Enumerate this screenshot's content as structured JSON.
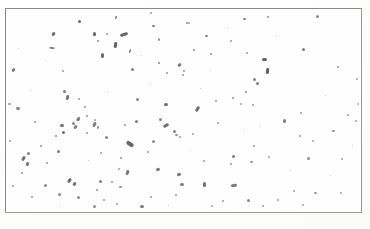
{
  "image": {
    "kind": "micrograph-field",
    "description": "Scanned light micrograph field showing scattered rod-shaped particles on a plain background within a thin rectangular border",
    "width": 370,
    "height": 229,
    "background_color": "#fdfdfc",
    "field_background_color": "#fefefe",
    "border_color": "#8d8d90",
    "particle_color": "#4a4a4e",
    "speck_color": "#b9b9bd"
  },
  "frame": {
    "x": 5,
    "y": 8,
    "width": 357,
    "height": 205
  },
  "particles": [
    {
      "x": 78,
      "y": 20,
      "w": 3,
      "h": 3,
      "r": 0,
      "o": 0.82
    },
    {
      "x": 115,
      "y": 16,
      "w": 2,
      "h": 3,
      "r": 20,
      "o": 0.7
    },
    {
      "x": 152,
      "y": 25,
      "w": 3,
      "h": 2,
      "r": 0,
      "o": 0.78
    },
    {
      "x": 186,
      "y": 22,
      "w": 2,
      "h": 2,
      "r": 0,
      "o": 0.62
    },
    {
      "x": 205,
      "y": 35,
      "w": 3,
      "h": 2,
      "r": 10,
      "o": 0.74
    },
    {
      "x": 243,
      "y": 18,
      "w": 3,
      "h": 2,
      "r": 0,
      "o": 0.72
    },
    {
      "x": 267,
      "y": 16,
      "w": 2,
      "h": 2,
      "r": 0,
      "o": 0.6
    },
    {
      "x": 316,
      "y": 15,
      "w": 3,
      "h": 3,
      "r": 0,
      "o": 0.66
    },
    {
      "x": 150,
      "y": 12,
      "w": 2,
      "h": 2,
      "r": 0,
      "o": 0.55
    },
    {
      "x": 52,
      "y": 32,
      "w": 3,
      "h": 4,
      "r": 35,
      "o": 0.8
    },
    {
      "x": 49,
      "y": 47,
      "w": 6,
      "h": 2,
      "r": 5,
      "o": 0.68
    },
    {
      "x": 93,
      "y": 32,
      "w": 3,
      "h": 4,
      "r": 0,
      "o": 0.85
    },
    {
      "x": 97,
      "y": 40,
      "w": 2,
      "h": 2,
      "r": 0,
      "o": 0.62
    },
    {
      "x": 106,
      "y": 33,
      "w": 2,
      "h": 2,
      "r": 0,
      "o": 0.55
    },
    {
      "x": 120,
      "y": 33,
      "w": 8,
      "h": 3,
      "r": -18,
      "o": 0.84
    },
    {
      "x": 114,
      "y": 42,
      "w": 3,
      "h": 6,
      "r": 8,
      "o": 0.86
    },
    {
      "x": 101,
      "y": 53,
      "w": 3,
      "h": 5,
      "r": 0,
      "o": 0.8
    },
    {
      "x": 129,
      "y": 49,
      "w": 2,
      "h": 4,
      "r": 20,
      "o": 0.66
    },
    {
      "x": 158,
      "y": 38,
      "w": 2,
      "h": 3,
      "r": 0,
      "o": 0.6
    },
    {
      "x": 158,
      "y": 62,
      "w": 2,
      "h": 2,
      "r": 0,
      "o": 0.66
    },
    {
      "x": 131,
      "y": 68,
      "w": 3,
      "h": 3,
      "r": 0,
      "o": 0.7
    },
    {
      "x": 166,
      "y": 72,
      "w": 2,
      "h": 2,
      "r": 0,
      "o": 0.58
    },
    {
      "x": 178,
      "y": 63,
      "w": 3,
      "h": 4,
      "r": 40,
      "o": 0.72
    },
    {
      "x": 182,
      "y": 74,
      "w": 2,
      "h": 2,
      "r": 0,
      "o": 0.55
    },
    {
      "x": 193,
      "y": 49,
      "w": 2,
      "h": 2,
      "r": 0,
      "o": 0.6
    },
    {
      "x": 210,
      "y": 53,
      "w": 2,
      "h": 2,
      "r": 0,
      "o": 0.62
    },
    {
      "x": 230,
      "y": 40,
      "w": 2,
      "h": 2,
      "r": 0,
      "o": 0.55
    },
    {
      "x": 246,
      "y": 52,
      "w": 2,
      "h": 2,
      "r": 0,
      "o": 0.58
    },
    {
      "x": 253,
      "y": 78,
      "w": 3,
      "h": 3,
      "r": 0,
      "o": 0.68
    },
    {
      "x": 262,
      "y": 58,
      "w": 5,
      "h": 3,
      "r": 0,
      "o": 0.86
    },
    {
      "x": 266,
      "y": 68,
      "w": 3,
      "h": 6,
      "r": 8,
      "o": 0.88
    },
    {
      "x": 256,
      "y": 82,
      "w": 3,
      "h": 3,
      "r": 0,
      "o": 0.7
    },
    {
      "x": 245,
      "y": 91,
      "w": 2,
      "h": 2,
      "r": 0,
      "o": 0.62
    },
    {
      "x": 232,
      "y": 97,
      "w": 2,
      "h": 2,
      "r": 0,
      "o": 0.58
    },
    {
      "x": 252,
      "y": 104,
      "w": 2,
      "h": 2,
      "r": 0,
      "o": 0.55
    },
    {
      "x": 302,
      "y": 48,
      "w": 3,
      "h": 3,
      "r": 0,
      "o": 0.7
    },
    {
      "x": 337,
      "y": 66,
      "w": 2,
      "h": 2,
      "r": 0,
      "o": 0.58
    },
    {
      "x": 356,
      "y": 78,
      "w": 2,
      "h": 2,
      "r": 0,
      "o": 0.52
    },
    {
      "x": 183,
      "y": 70,
      "w": 2,
      "h": 2,
      "r": 0,
      "o": 0.55
    },
    {
      "x": 188,
      "y": 22,
      "w": 2,
      "h": 2,
      "r": 0,
      "o": 0.52
    },
    {
      "x": 12,
      "y": 68,
      "w": 3,
      "h": 4,
      "r": 40,
      "o": 0.72
    },
    {
      "x": 16,
      "y": 107,
      "w": 4,
      "h": 3,
      "r": 25,
      "o": 0.66
    },
    {
      "x": 8,
      "y": 103,
      "w": 3,
      "h": 2,
      "r": 0,
      "o": 0.58
    },
    {
      "x": 63,
      "y": 90,
      "w": 3,
      "h": 3,
      "r": 0,
      "o": 0.74
    },
    {
      "x": 66,
      "y": 95,
      "w": 3,
      "h": 5,
      "r": 15,
      "o": 0.76
    },
    {
      "x": 78,
      "y": 98,
      "w": 2,
      "h": 2,
      "r": 0,
      "o": 0.58
    },
    {
      "x": 84,
      "y": 106,
      "w": 2,
      "h": 2,
      "r": 0,
      "o": 0.55
    },
    {
      "x": 62,
      "y": 70,
      "w": 2,
      "h": 2,
      "r": 0,
      "o": 0.55
    },
    {
      "x": 86,
      "y": 115,
      "w": 2,
      "h": 2,
      "r": 0,
      "o": 0.6
    },
    {
      "x": 60,
      "y": 124,
      "w": 4,
      "h": 3,
      "r": 0,
      "o": 0.78
    },
    {
      "x": 62,
      "y": 131,
      "w": 3,
      "h": 3,
      "r": 0,
      "o": 0.8
    },
    {
      "x": 55,
      "y": 135,
      "w": 2,
      "h": 2,
      "r": 0,
      "o": 0.6
    },
    {
      "x": 34,
      "y": 121,
      "w": 2,
      "h": 2,
      "r": 0,
      "o": 0.58
    },
    {
      "x": 86,
      "y": 132,
      "w": 2,
      "h": 2,
      "r": 0,
      "o": 0.55
    },
    {
      "x": 40,
      "y": 145,
      "w": 2,
      "h": 2,
      "r": 0,
      "o": 0.58
    },
    {
      "x": 126,
      "y": 142,
      "w": 8,
      "h": 4,
      "r": 35,
      "o": 0.84
    },
    {
      "x": 135,
      "y": 120,
      "w": 3,
      "h": 3,
      "r": 0,
      "o": 0.72
    },
    {
      "x": 136,
      "y": 98,
      "w": 3,
      "h": 3,
      "r": 0,
      "o": 0.66
    },
    {
      "x": 164,
      "y": 103,
      "w": 4,
      "h": 3,
      "r": 0,
      "o": 0.78
    },
    {
      "x": 196,
      "y": 106,
      "w": 3,
      "h": 6,
      "r": 30,
      "o": 0.8
    },
    {
      "x": 163,
      "y": 124,
      "w": 6,
      "h": 3,
      "r": -30,
      "o": 0.8
    },
    {
      "x": 173,
      "y": 130,
      "w": 3,
      "h": 3,
      "r": 0,
      "o": 0.68
    },
    {
      "x": 175,
      "y": 134,
      "w": 3,
      "h": 2,
      "r": 0,
      "o": 0.62
    },
    {
      "x": 179,
      "y": 136,
      "w": 2,
      "h": 2,
      "r": 0,
      "o": 0.55
    },
    {
      "x": 215,
      "y": 100,
      "w": 2,
      "h": 2,
      "r": 0,
      "o": 0.55
    },
    {
      "x": 240,
      "y": 103,
      "w": 2,
      "h": 2,
      "r": 0,
      "o": 0.52
    },
    {
      "x": 299,
      "y": 135,
      "w": 2,
      "h": 2,
      "r": 0,
      "o": 0.55
    },
    {
      "x": 312,
      "y": 140,
      "w": 2,
      "h": 2,
      "r": 0,
      "o": 0.52
    },
    {
      "x": 77,
      "y": 117,
      "w": 3,
      "h": 4,
      "r": 20,
      "o": 0.7
    },
    {
      "x": 100,
      "y": 152,
      "w": 2,
      "h": 2,
      "r": 0,
      "o": 0.58
    },
    {
      "x": 72,
      "y": 122,
      "w": 3,
      "h": 3,
      "r": 0,
      "o": 0.66
    },
    {
      "x": 124,
      "y": 124,
      "w": 2,
      "h": 2,
      "r": 0,
      "o": 0.55
    },
    {
      "x": 76,
      "y": 119,
      "w": 2,
      "h": 2,
      "r": 0,
      "o": 0.5
    },
    {
      "x": 94,
      "y": 119,
      "w": 2,
      "h": 2,
      "r": 0,
      "o": 0.52
    },
    {
      "x": 159,
      "y": 118,
      "w": 3,
      "h": 3,
      "r": 0,
      "o": 0.66
    },
    {
      "x": 152,
      "y": 140,
      "w": 3,
      "h": 3,
      "r": 0,
      "o": 0.64
    },
    {
      "x": 120,
      "y": 157,
      "w": 2,
      "h": 2,
      "r": 0,
      "o": 0.58
    },
    {
      "x": 147,
      "y": 151,
      "w": 2,
      "h": 2,
      "r": 0,
      "o": 0.55
    },
    {
      "x": 74,
      "y": 125,
      "w": 3,
      "h": 4,
      "r": 45,
      "o": 0.68
    },
    {
      "x": 105,
      "y": 136,
      "w": 3,
      "h": 3,
      "r": 0,
      "o": 0.68
    },
    {
      "x": 93,
      "y": 122,
      "w": 3,
      "h": 5,
      "r": 25,
      "o": 0.72
    },
    {
      "x": 97,
      "y": 126,
      "w": 2,
      "h": 3,
      "r": 20,
      "o": 0.62
    },
    {
      "x": 27,
      "y": 152,
      "w": 3,
      "h": 3,
      "r": 0,
      "o": 0.7
    },
    {
      "x": 22,
      "y": 156,
      "w": 3,
      "h": 5,
      "r": 30,
      "o": 0.78
    },
    {
      "x": 26,
      "y": 162,
      "w": 3,
      "h": 4,
      "r": 30,
      "o": 0.76
    },
    {
      "x": 21,
      "y": 172,
      "w": 2,
      "h": 2,
      "r": 0,
      "o": 0.58
    },
    {
      "x": 46,
      "y": 162,
      "w": 2,
      "h": 2,
      "r": 0,
      "o": 0.55
    },
    {
      "x": 57,
      "y": 150,
      "w": 3,
      "h": 3,
      "r": 0,
      "o": 0.72
    },
    {
      "x": 68,
      "y": 178,
      "w": 3,
      "h": 5,
      "r": 35,
      "o": 0.8
    },
    {
      "x": 73,
      "y": 182,
      "w": 3,
      "h": 4,
      "r": 35,
      "o": 0.76
    },
    {
      "x": 44,
      "y": 184,
      "w": 3,
      "h": 3,
      "r": 0,
      "o": 0.66
    },
    {
      "x": 31,
      "y": 196,
      "w": 2,
      "h": 2,
      "r": 0,
      "o": 0.58
    },
    {
      "x": 58,
      "y": 193,
      "w": 3,
      "h": 3,
      "r": 0,
      "o": 0.64
    },
    {
      "x": 77,
      "y": 196,
      "w": 3,
      "h": 3,
      "r": 0,
      "o": 0.66
    },
    {
      "x": 96,
      "y": 189,
      "w": 2,
      "h": 2,
      "r": 0,
      "o": 0.58
    },
    {
      "x": 99,
      "y": 180,
      "w": 3,
      "h": 3,
      "r": 0,
      "o": 0.7
    },
    {
      "x": 111,
      "y": 181,
      "w": 2,
      "h": 2,
      "r": 0,
      "o": 0.58
    },
    {
      "x": 119,
      "y": 186,
      "w": 3,
      "h": 2,
      "r": 0,
      "o": 0.62
    },
    {
      "x": 103,
      "y": 199,
      "w": 2,
      "h": 2,
      "r": 0,
      "o": 0.55
    },
    {
      "x": 93,
      "y": 205,
      "w": 3,
      "h": 3,
      "r": 0,
      "o": 0.64
    },
    {
      "x": 116,
      "y": 203,
      "w": 2,
      "h": 2,
      "r": 0,
      "o": 0.55
    },
    {
      "x": 126,
      "y": 170,
      "w": 3,
      "h": 5,
      "r": 20,
      "o": 0.76
    },
    {
      "x": 140,
      "y": 205,
      "w": 4,
      "h": 3,
      "r": 0,
      "o": 0.7
    },
    {
      "x": 150,
      "y": 196,
      "w": 2,
      "h": 2,
      "r": 0,
      "o": 0.55
    },
    {
      "x": 175,
      "y": 194,
      "w": 2,
      "h": 2,
      "r": 0,
      "o": 0.55
    },
    {
      "x": 118,
      "y": 168,
      "w": 2,
      "h": 2,
      "r": 0,
      "o": 0.52
    },
    {
      "x": 156,
      "y": 168,
      "w": 4,
      "h": 3,
      "r": -25,
      "o": 0.74
    },
    {
      "x": 177,
      "y": 173,
      "w": 4,
      "h": 3,
      "r": -20,
      "o": 0.76
    },
    {
      "x": 180,
      "y": 183,
      "w": 4,
      "h": 3,
      "r": 0,
      "o": 0.7
    },
    {
      "x": 203,
      "y": 160,
      "w": 2,
      "h": 2,
      "r": 0,
      "o": 0.55
    },
    {
      "x": 232,
      "y": 155,
      "w": 3,
      "h": 3,
      "r": 0,
      "o": 0.72
    },
    {
      "x": 253,
      "y": 145,
      "w": 2,
      "h": 2,
      "r": 0,
      "o": 0.58
    },
    {
      "x": 250,
      "y": 161,
      "w": 3,
      "h": 2,
      "r": 0,
      "o": 0.62
    },
    {
      "x": 230,
      "y": 163,
      "w": 2,
      "h": 2,
      "r": 0,
      "o": 0.55
    },
    {
      "x": 268,
      "y": 156,
      "w": 2,
      "h": 2,
      "r": 0,
      "o": 0.52
    },
    {
      "x": 307,
      "y": 157,
      "w": 3,
      "h": 3,
      "r": 0,
      "o": 0.62
    },
    {
      "x": 341,
      "y": 158,
      "w": 2,
      "h": 2,
      "r": 0,
      "o": 0.52
    },
    {
      "x": 203,
      "y": 182,
      "w": 3,
      "h": 5,
      "r": 0,
      "o": 0.78
    },
    {
      "x": 231,
      "y": 184,
      "w": 6,
      "h": 3,
      "r": -10,
      "o": 0.72
    },
    {
      "x": 247,
      "y": 199,
      "w": 3,
      "h": 3,
      "r": 0,
      "o": 0.66
    },
    {
      "x": 262,
      "y": 205,
      "w": 2,
      "h": 2,
      "r": 0,
      "o": 0.55
    },
    {
      "x": 277,
      "y": 199,
      "w": 2,
      "h": 2,
      "r": 0,
      "o": 0.55
    },
    {
      "x": 293,
      "y": 190,
      "w": 2,
      "h": 2,
      "r": 0,
      "o": 0.52
    },
    {
      "x": 302,
      "y": 204,
      "w": 2,
      "h": 2,
      "r": 0,
      "o": 0.52
    },
    {
      "x": 314,
      "y": 192,
      "w": 3,
      "h": 2,
      "r": 0,
      "o": 0.58
    },
    {
      "x": 340,
      "y": 192,
      "w": 2,
      "h": 2,
      "r": 0,
      "o": 0.52
    },
    {
      "x": 222,
      "y": 200,
      "w": 2,
      "h": 2,
      "r": 0,
      "o": 0.55
    },
    {
      "x": 211,
      "y": 205,
      "w": 2,
      "h": 2,
      "r": 0,
      "o": 0.52
    },
    {
      "x": 283,
      "y": 119,
      "w": 3,
      "h": 4,
      "r": 0,
      "o": 0.7
    },
    {
      "x": 300,
      "y": 112,
      "w": 2,
      "h": 2,
      "r": 0,
      "o": 0.55
    },
    {
      "x": 332,
      "y": 130,
      "w": 3,
      "h": 2,
      "r": -20,
      "o": 0.62
    },
    {
      "x": 347,
      "y": 114,
      "w": 2,
      "h": 2,
      "r": 0,
      "o": 0.52
    },
    {
      "x": 357,
      "y": 103,
      "w": 2,
      "h": 2,
      "r": 0,
      "o": 0.5
    },
    {
      "x": 355,
      "y": 120,
      "w": 2,
      "h": 2,
      "r": 0,
      "o": 0.5
    },
    {
      "x": 9,
      "y": 140,
      "w": 2,
      "h": 2,
      "r": 0,
      "o": 0.5
    },
    {
      "x": 12,
      "y": 185,
      "w": 2,
      "h": 2,
      "r": 0,
      "o": 0.5
    },
    {
      "x": 192,
      "y": 133,
      "w": 2,
      "h": 2,
      "r": 0,
      "o": 0.5
    },
    {
      "x": 217,
      "y": 122,
      "w": 2,
      "h": 2,
      "r": 0,
      "o": 0.5
    }
  ],
  "specks": [
    {
      "x": 45,
      "y": 60,
      "s": 1
    },
    {
      "x": 140,
      "y": 55,
      "s": 1
    },
    {
      "x": 200,
      "y": 88,
      "s": 1
    },
    {
      "x": 275,
      "y": 36,
      "s": 1
    },
    {
      "x": 325,
      "y": 95,
      "s": 1
    },
    {
      "x": 88,
      "y": 160,
      "s": 1
    },
    {
      "x": 190,
      "y": 150,
      "s": 1
    },
    {
      "x": 260,
      "y": 126,
      "s": 1
    },
    {
      "x": 330,
      "y": 175,
      "s": 1
    },
    {
      "x": 150,
      "y": 84,
      "s": 1
    },
    {
      "x": 30,
      "y": 90,
      "s": 1
    },
    {
      "x": 210,
      "y": 70,
      "s": 1
    },
    {
      "x": 290,
      "y": 170,
      "s": 1
    },
    {
      "x": 108,
      "y": 92,
      "s": 1
    },
    {
      "x": 244,
      "y": 130,
      "s": 1
    },
    {
      "x": 60,
      "y": 205,
      "s": 1
    },
    {
      "x": 168,
      "y": 205,
      "s": 1
    },
    {
      "x": 352,
      "y": 145,
      "s": 1
    },
    {
      "x": 18,
      "y": 48,
      "s": 1
    },
    {
      "x": 228,
      "y": 28,
      "s": 1
    }
  ]
}
